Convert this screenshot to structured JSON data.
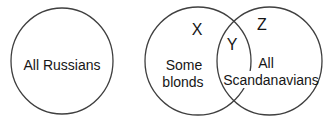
{
  "diagram": {
    "colors": {
      "background": "#ffffff",
      "stroke": "#3f3f3f",
      "text": "#161616"
    },
    "standalone_circle": {
      "label": "All Russians"
    },
    "venn": {
      "left_circle_letter": "X",
      "intersection_letter": "Y",
      "right_circle_letter": "Z",
      "left_circle_text": [
        "Some",
        "blonds"
      ],
      "right_circle_text": [
        "All",
        "Scandanavians"
      ]
    }
  }
}
